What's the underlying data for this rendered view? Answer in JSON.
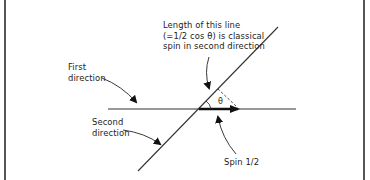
{
  "diagram": {
    "type": "spin-projection-vector-diagram",
    "labels": {
      "first_direction": [
        "First",
        "direction"
      ],
      "second_direction": [
        "Second",
        "direction"
      ],
      "length_note": [
        "Length of this line",
        "(=1/2 cos θ) is classical",
        "spin in second direction"
      ],
      "spin": "Spin 1/2",
      "angle": "θ"
    },
    "colors": {
      "line": "#222222",
      "border": "#555555",
      "background": "#ffffff"
    }
  }
}
